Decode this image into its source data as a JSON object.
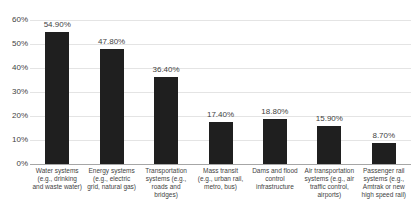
{
  "chart_data": {
    "type": "bar",
    "title": "",
    "xlabel": "",
    "ylabel": "",
    "ylim": [
      0,
      60
    ],
    "grid": true,
    "legend": "none",
    "yticks": [
      "0%",
      "10%",
      "20%",
      "30%",
      "40%",
      "50%",
      "60%"
    ],
    "ytick_values": [
      0,
      10,
      20,
      30,
      40,
      50,
      60
    ],
    "bar_color": "#1f1f1f",
    "gridline_color": "#e4e4e4",
    "axis_color": "#a6a6a6",
    "categories": [
      "Water systems (e.g., drinking and waste water)",
      "Energy systems (e.g., electric grid, natural gas)",
      "Transportation systems (e.g., roads and bridges)",
      "Mass transit (e.g., urban rail, metro, bus)",
      "Dams and flood control infrastructure",
      "Air transportation systems (e.g., air traffic control, airports)",
      "Passenger rail systems (e.g., Amtrak or new high speed rail)"
    ],
    "values": [
      54.9,
      47.8,
      36.4,
      17.4,
      18.8,
      15.9,
      8.7
    ],
    "data_labels": [
      "54.90%",
      "47.80%",
      "36.40%",
      "17.40%",
      "18.80%",
      "15.90%",
      "8.70%"
    ]
  }
}
